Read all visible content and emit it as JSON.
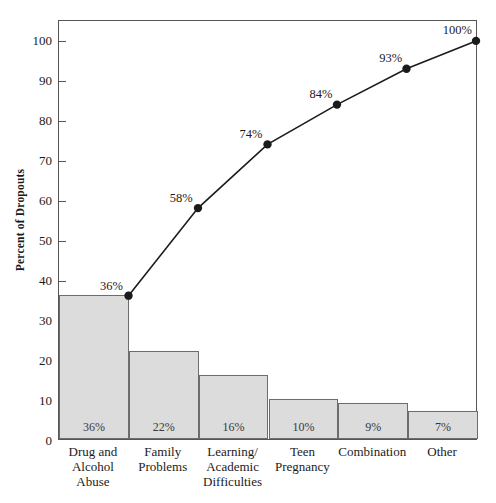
{
  "chart_data": {
    "type": "bar",
    "title": "",
    "subtitle": "",
    "xlabel": "",
    "ylabel": "Percent of Dropouts",
    "ylim": [
      0,
      105
    ],
    "yticks": [
      0,
      10,
      20,
      30,
      40,
      50,
      60,
      70,
      80,
      90,
      100
    ],
    "ytick_labels": [
      "0",
      "10",
      "20",
      "30",
      "40",
      "50",
      "60",
      "70",
      "80",
      "90",
      "100"
    ],
    "grid": false,
    "legend": null,
    "categories": [
      "Drug and\nAlcohol\nAbuse",
      "Family\nProblems",
      "Learning/\nAcademic\nDifficulties",
      "Teen\nPregnancy",
      "Combination",
      "Other"
    ],
    "series": [
      {
        "name": "Percent of Dropouts",
        "type": "bar",
        "values": [
          36,
          22,
          16,
          10,
          9,
          7
        ],
        "data_labels": [
          "36%",
          "22%",
          "16%",
          "10%",
          "9%",
          "7%"
        ],
        "fill_color": "#dcdcdc",
        "edge_color": "#6d6d6d"
      },
      {
        "name": "Cumulative Percent",
        "type": "line",
        "values": [
          36,
          58,
          74,
          84,
          93,
          100
        ],
        "data_labels": [
          "36%",
          "58%",
          "74%",
          "84%",
          "93%",
          "100%"
        ],
        "line_color": "#1b1b1b",
        "marker": "circle"
      }
    ]
  },
  "axis": {
    "y_title": "Percent of Dropouts"
  }
}
